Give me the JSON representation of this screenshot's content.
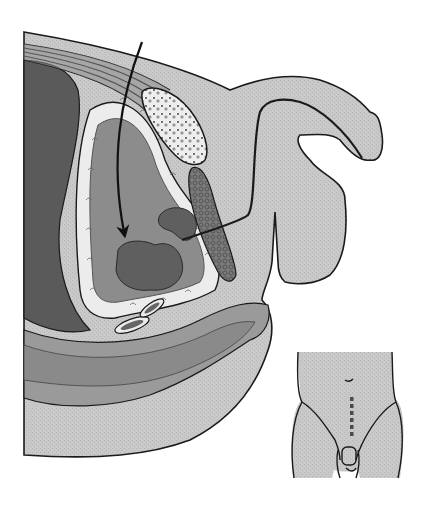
{
  "figure": {
    "type": "anatomical-illustration",
    "view": "sagittal-pelvic-cross-section",
    "width": 429,
    "height": 512,
    "background": "#ffffff",
    "colors": {
      "outline": "#1a1a1a",
      "skin_light": "#c9c9c9",
      "tissue_mid": "#9a9a9a",
      "organ_dark": "#6e6e6e",
      "cavity_dark": "#5a5a5a",
      "fat_white": "#ececec",
      "mass_dark": "#5f5f5f",
      "arrow": "#111111"
    },
    "elements": [
      {
        "name": "abdominal-wall",
        "description": "layered muscle bands across top"
      },
      {
        "name": "pubic-bone",
        "description": "speckled oval bone"
      },
      {
        "name": "bladder",
        "description": "large cavity outlined by white fatty tissue"
      },
      {
        "name": "tumor-mass-large",
        "description": "dark mass at base of bladder"
      },
      {
        "name": "tumor-mass-small",
        "description": "dark mass near bladder neck"
      },
      {
        "name": "prostate-gland",
        "description": "cross-hatched elongated gland"
      },
      {
        "name": "urethra",
        "description": "curved dark tube to external genitalia"
      },
      {
        "name": "external-genitalia",
        "description": "light grey shape at right"
      },
      {
        "name": "rectum",
        "description": "curved layered band below bladder"
      },
      {
        "name": "vessels",
        "description": "two small oval vessels between bladder and rectum"
      },
      {
        "name": "surgical-access-arrow",
        "description": "curved arrow from top into bladder"
      }
    ]
  },
  "inset": {
    "name": "torso-inset",
    "description": "front view of lower torso showing midline incision",
    "incision_style": "dashed vertical line",
    "incision_dashes": 6,
    "position": {
      "x": 290,
      "y": 350,
      "width": 120,
      "height": 140
    }
  }
}
